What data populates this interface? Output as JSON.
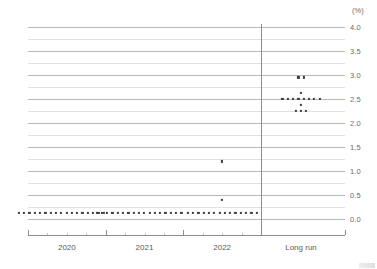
{
  "chart_data": {
    "type": "scatter",
    "title": "",
    "subtitle": "",
    "xlabel": "",
    "ylabel": "",
    "unit_label": "(%)",
    "ylim": [
      0.0,
      4.0
    ],
    "ytick_values": [
      0.0,
      0.5,
      1.0,
      1.5,
      2.0,
      2.5,
      3.0,
      3.5,
      4.0
    ],
    "ytick_labels": [
      "0.0",
      "0.5",
      "1.0",
      "1.5",
      "2.0",
      "2.5",
      "3.0",
      "3.5",
      "4.0"
    ],
    "yminor_values": [
      0.25,
      0.75,
      1.25,
      1.75,
      2.25,
      2.75,
      3.25,
      3.75
    ],
    "grid": true,
    "legend": "none",
    "categories": [
      "2020",
      "2021",
      "2022",
      "Long run"
    ],
    "divider_after_category": "2022",
    "series": [
      {
        "name": "2020",
        "category": "2020",
        "points": [
          {
            "value": 0.125,
            "count": 17
          }
        ]
      },
      {
        "name": "2021",
        "category": "2021",
        "points": [
          {
            "value": 0.125,
            "count": 17
          }
        ]
      },
      {
        "name": "2022",
        "category": "2022",
        "points": [
          {
            "value": 1.2,
            "count": 1
          },
          {
            "value": 0.4,
            "count": 1
          },
          {
            "value": 0.125,
            "count": 14
          }
        ]
      },
      {
        "name": "Long run",
        "category": "Long run",
        "points": [
          {
            "value": 2.95,
            "count": 2
          },
          {
            "value": 2.63,
            "count": 1
          },
          {
            "value": 2.5,
            "count": 8
          },
          {
            "value": 2.38,
            "count": 1
          },
          {
            "value": 2.25,
            "count": 3
          }
        ]
      }
    ]
  },
  "axis": {
    "unit": "(%)",
    "y_labels": [
      "4.0",
      "3.5",
      "3.0",
      "2.5",
      "2.0",
      "1.5",
      "1.0",
      "0.5",
      "0.0"
    ],
    "x_labels": [
      "2020",
      "2021",
      "2022",
      "Long run"
    ]
  },
  "colors": {
    "dot": "#3c3c3c",
    "gridline_major": "#b8b8b8",
    "gridline_minor": "#e2e2e2",
    "axis": "#8d8d8d",
    "text": "#5a5a5a"
  }
}
